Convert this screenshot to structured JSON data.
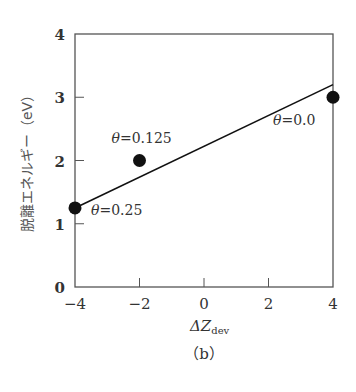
{
  "chart_data": {
    "type": "scatter",
    "title": "",
    "caption": "（b）",
    "xlabel": "ΔZ",
    "xlabel_sub": "dev",
    "ylabel": "脱離エネルギー（eV）",
    "xlim": [
      -4,
      4
    ],
    "ylim": [
      0,
      4
    ],
    "x_ticks": [
      "−4",
      "−2",
      "0",
      "2",
      "4"
    ],
    "y_ticks": [
      "0",
      "1",
      "2",
      "3",
      "4"
    ],
    "grid": false,
    "legend": null,
    "series": [
      {
        "name": "data points",
        "type": "scatter",
        "points": [
          {
            "x": -4,
            "y": 1.25,
            "label": "θ=0.25"
          },
          {
            "x": -2,
            "y": 2.0,
            "label": "θ=0.125"
          },
          {
            "x": 4,
            "y": 3.0,
            "label": "θ=0.0"
          }
        ]
      },
      {
        "name": "linear fit",
        "type": "line",
        "points": [
          {
            "x": -4,
            "y": 1.25
          },
          {
            "x": 4,
            "y": 3.2
          }
        ]
      }
    ]
  }
}
